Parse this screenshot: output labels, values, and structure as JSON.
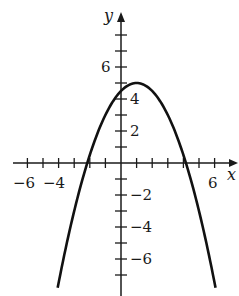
{
  "chart_data": {
    "type": "line",
    "title": "",
    "xlabel": "x",
    "ylabel": "y",
    "xlim": [
      -7,
      7
    ],
    "ylim": [
      -8,
      9
    ],
    "grid": false,
    "x_tick_labels": [
      "-6",
      "-4",
      "6"
    ],
    "y_tick_labels": [
      "6",
      "4",
      "2",
      "-2",
      "-4",
      "-6"
    ],
    "x_ticks": [
      -6,
      -5,
      -4,
      -3,
      -2,
      -1,
      1,
      2,
      3,
      4,
      5,
      6
    ],
    "y_ticks": [
      8,
      7,
      6,
      5,
      4,
      3,
      2,
      1,
      -1,
      -2,
      -3,
      -4,
      -5,
      -6,
      -7
    ],
    "series": [
      {
        "name": "parabola",
        "equation": "y = -0.5(x - 1)^2 + 5",
        "vertex": [
          1,
          5
        ],
        "x_intercepts": [
          -2.16,
          4.16
        ],
        "y_intercept": 4.5,
        "x": [
          -4.06,
          -3,
          -2.16,
          -1,
          0,
          1,
          2,
          3,
          4.16,
          5,
          6.06
        ],
        "values": [
          -7.8,
          -3,
          0,
          3,
          4.5,
          5,
          4.5,
          3,
          0,
          -3,
          -7.8
        ]
      }
    ]
  },
  "labels": {
    "x_axis": "x",
    "y_axis": "y",
    "x_neg6": "−6",
    "x_neg4": "−4",
    "x_pos6": "6",
    "y_pos6": "6",
    "y_pos4": "4",
    "y_pos2": "2",
    "y_neg2": "−2",
    "y_neg4": "−4",
    "y_neg6": "−6"
  }
}
